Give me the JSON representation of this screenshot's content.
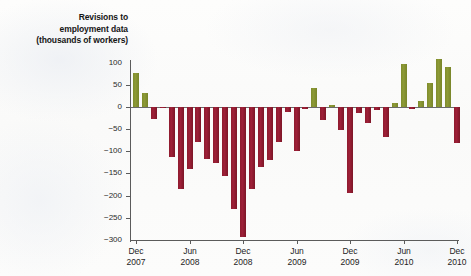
{
  "title": {
    "line1": "Revisions to",
    "line2": "employment data",
    "line3": "(thousands of workers)"
  },
  "colors": {
    "positive": "#8d9a36",
    "negative": "#9e2038",
    "axis": "#5b5b5b",
    "background": "#fbfbfa"
  },
  "chart_data": {
    "type": "bar",
    "title": "Revisions to employment data (thousands of workers)",
    "xlabel": "",
    "ylabel": "thousands of workers",
    "ylim": [
      -300,
      100
    ],
    "yticks": [
      100,
      50,
      0,
      -50,
      -100,
      -150,
      -200,
      -250,
      -300
    ],
    "ytick_labels": [
      "100",
      "50",
      "0",
      "−50",
      "−100",
      "−150",
      "−200",
      "−250",
      "−300"
    ],
    "grid": false,
    "legend": null,
    "xtick_labels": [
      {
        "month": "Dec",
        "year": "2007"
      },
      {
        "month": "Jun",
        "year": "2008"
      },
      {
        "month": "Dec",
        "year": "2008"
      },
      {
        "month": "Jun",
        "year": "2009"
      },
      {
        "month": "Dec",
        "year": "2009"
      },
      {
        "month": "Jun",
        "year": "2010"
      },
      {
        "month": "Dec",
        "year": "2010"
      }
    ],
    "categories": [
      "Dec 2007",
      "Jan 2008",
      "Feb 2008",
      "Mar 2008",
      "Apr 2008",
      "May 2008",
      "Jun 2008",
      "Jul 2008",
      "Aug 2008",
      "Sep 2008",
      "Oct 2008",
      "Nov 2008",
      "Dec 2008",
      "Jan 2009",
      "Feb 2009",
      "Mar 2009",
      "Apr 2009",
      "May 2009",
      "Jun 2009",
      "Jul 2009",
      "Aug 2009",
      "Sep 2009",
      "Oct 2009",
      "Nov 2009",
      "Dec 2009",
      "Jan 2010",
      "Feb 2010",
      "Mar 2010",
      "Apr 2010",
      "May 2010",
      "Jun 2010",
      "Jul 2010",
      "Aug 2010",
      "Sep 2010",
      "Oct 2010",
      "Nov 2010",
      "Dec 2010"
    ],
    "values": [
      77,
      32,
      -26,
      -3,
      -113,
      -186,
      -140,
      -80,
      -117,
      -126,
      -155,
      -230,
      -293,
      -186,
      -135,
      -120,
      -79,
      -12,
      -100,
      -4,
      42,
      -29,
      4,
      -52,
      -194,
      -13,
      -36,
      -6,
      -67,
      8,
      97,
      -4,
      14,
      55,
      108,
      91,
      -82
    ]
  }
}
